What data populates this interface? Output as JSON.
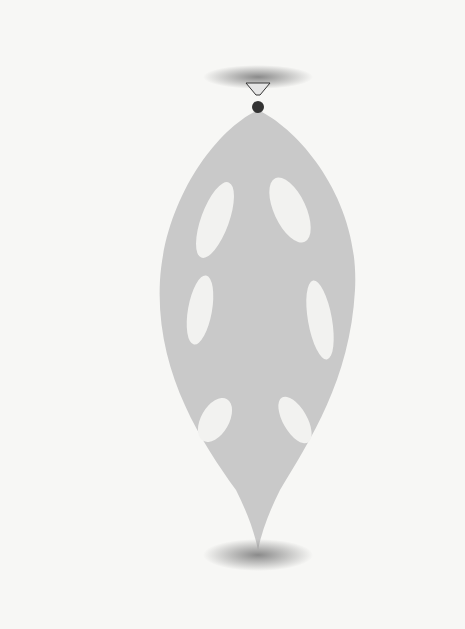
{
  "figure": {
    "caption": "Fig. 4–23",
    "labels": {
      "axis_top": "a",
      "axis_bottom": "a′",
      "moment_axis_end": "b",
      "moment_axis_start": "b′",
      "origin": "O",
      "angle": "θ",
      "projected_moment_symbol": "M",
      "projected_moment_sub": "a",
      "moment_symbol": "M",
      "moment_sub": "O",
      "moment_eq": " = r × F",
      "position_vector": "r",
      "point": "A",
      "force": "F"
    },
    "callouts": {
      "moment_axis": "Moment axis",
      "axis_of_projection": "Axis of projection"
    },
    "colors": {
      "background": "#f7f7f5",
      "line": "#111111",
      "shade_light": "#c8c8c8",
      "shade_dark": "#6a6a6a"
    }
  }
}
